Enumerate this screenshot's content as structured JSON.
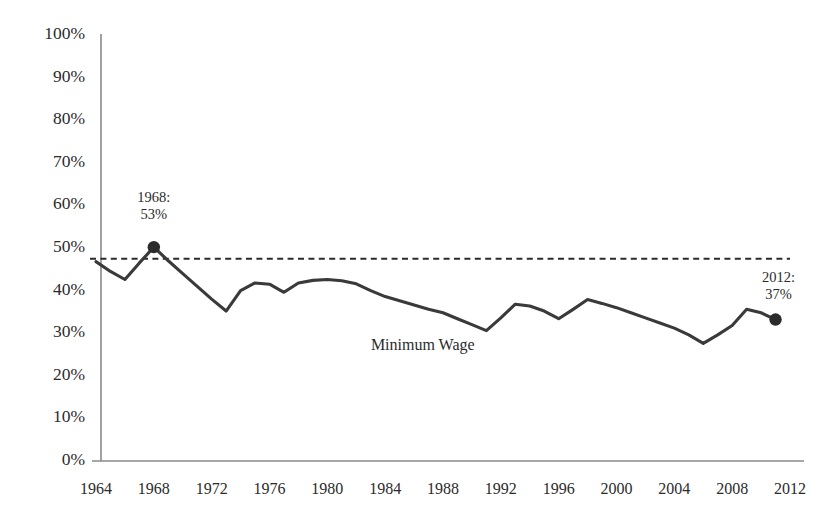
{
  "chart_data": {
    "type": "line",
    "title": "",
    "xlabel": "",
    "ylabel": "",
    "xlim": [
      1963,
      2013
    ],
    "ylim": [
      0,
      100
    ],
    "grid": false,
    "legend": "inline-label",
    "y_ticks": [
      "0%",
      "10%",
      "20%",
      "30%",
      "40%",
      "50%",
      "60%",
      "70%",
      "80%",
      "90%",
      "100%"
    ],
    "y_tick_values": [
      0,
      10,
      20,
      30,
      40,
      50,
      60,
      70,
      80,
      90,
      100
    ],
    "x_ticks": [
      "1964",
      "1968",
      "1972",
      "1976",
      "1980",
      "1984",
      "1988",
      "1992",
      "1996",
      "2000",
      "2004",
      "2008",
      "2012"
    ],
    "x_tick_values": [
      1964,
      1968,
      1972,
      1976,
      1980,
      1984,
      1988,
      1992,
      1996,
      2000,
      2004,
      2008,
      2012
    ],
    "series": [
      {
        "name": "Minimum Wage",
        "color": "#3a3a3a",
        "x": [
          1964,
          1965,
          1966,
          1967,
          1968,
          1969,
          1970,
          1971,
          1972,
          1973,
          1974,
          1975,
          1976,
          1977,
          1978,
          1979,
          1980,
          1981,
          1982,
          1983,
          1984,
          1985,
          1986,
          1987,
          1988,
          1989,
          1990,
          1991,
          1992,
          1993,
          1994,
          1995,
          1996,
          1997,
          1998,
          1999,
          2000,
          2001,
          2002,
          2003,
          2004,
          2005,
          2006,
          2007,
          2008,
          2009,
          2010,
          2011
        ],
        "values": [
          46.8,
          44.5,
          42.6,
          46.5,
          50.2,
          47.0,
          44.0,
          41.0,
          38.0,
          35.2,
          40.0,
          41.8,
          41.5,
          39.6,
          41.8,
          42.4,
          42.6,
          42.3,
          41.6,
          40.0,
          38.6,
          37.6,
          36.6,
          35.6,
          34.8,
          33.4,
          32.0,
          30.6,
          33.6,
          36.8,
          36.4,
          35.2,
          33.4,
          35.6,
          37.9,
          37.0,
          36.0,
          34.8,
          33.6,
          32.4,
          31.2,
          29.6,
          27.6,
          29.6,
          31.8,
          35.6,
          34.8,
          33.2
        ]
      }
    ],
    "reference_line": {
      "name": "benchmark",
      "value": 47.5,
      "color": "#2b2b2b",
      "style": "dashed",
      "x_start": 1964,
      "x_end": 2012
    },
    "annotations": [
      {
        "id": "peak",
        "line1": "1968:",
        "line2": "53%",
        "x": 1968,
        "y": 50.2,
        "label_x": 1968,
        "label_y": 61.5
      },
      {
        "id": "endpoint",
        "line1": "2012:",
        "line2": "37%",
        "x": 2011,
        "y": 33.2,
        "label_x": 2011.2,
        "label_y": 42.8
      }
    ],
    "markers": [
      {
        "id": "peak-marker",
        "x": 1968,
        "y": 50.2,
        "radius": 6.2,
        "color": "#2b2b2b"
      },
      {
        "id": "endpoint-marker",
        "x": 2011,
        "y": 33.2,
        "radius": 6.2,
        "color": "#2b2b2b"
      }
    ],
    "series_label": {
      "text": "Minimum Wage",
      "x": 1986.6,
      "y": 27.0
    }
  }
}
